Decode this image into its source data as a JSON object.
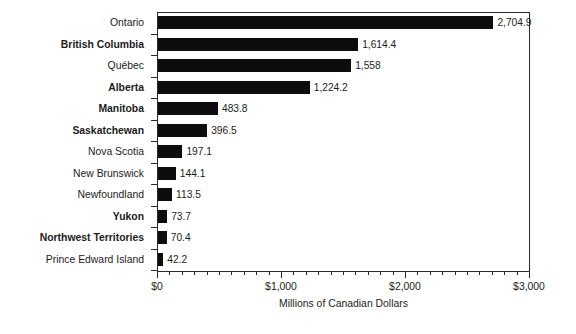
{
  "chart_data": {
    "type": "bar",
    "orientation": "horizontal",
    "title": "",
    "xlabel": "Millions of Canadian Dollars",
    "ylabel": "",
    "xlim": [
      0,
      3000
    ],
    "grid": false,
    "legend": null,
    "x_major_ticks": [
      0,
      1000,
      2000,
      3000
    ],
    "x_major_tick_labels": [
      "$0",
      "$1,000",
      "$2,000",
      "$3,000"
    ],
    "x_minor_tick_interval": 100,
    "categories": [
      "Ontario",
      "British Columbia",
      "Québec",
      "Alberta",
      "Manitoba",
      "Saskatchewan",
      "Nova Scotia",
      "New Brunswick",
      "Newfoundland",
      "Yukon",
      "Northwest Territories",
      "Prince Edward Island"
    ],
    "values": [
      2704.9,
      1614.4,
      1558,
      1224.2,
      483.8,
      396.5,
      197.1,
      144.1,
      113.5,
      73.7,
      70.4,
      42.2
    ],
    "value_labels": [
      "2,704.9",
      "1,614.4",
      "1,558",
      "1,224.2",
      "483.8",
      "396.5",
      "197.1",
      "144.1",
      "113.5",
      "73.7",
      "70.4",
      "42.2"
    ],
    "category_bold": [
      false,
      true,
      false,
      true,
      true,
      true,
      false,
      false,
      false,
      true,
      true,
      false
    ],
    "bar_color": "#0d0d0d",
    "axis_color": "#2b2b2b",
    "text_color": "#1c1c1c",
    "background_color": "#ffffff"
  }
}
